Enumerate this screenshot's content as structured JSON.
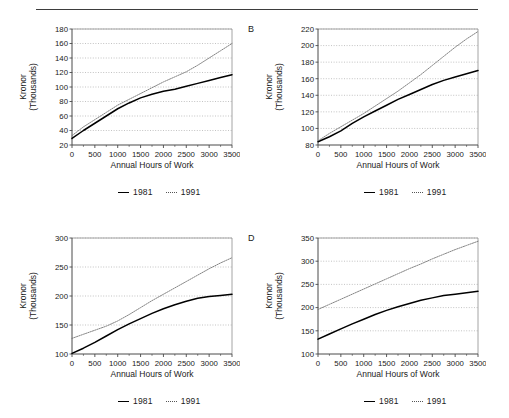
{
  "header": {
    "running_head": "",
    "rule": "horizontal-rule"
  },
  "common": {
    "x_axis_title": "Annual Hours of Work",
    "y_axis_title_line1": "Kronor",
    "y_axis_title_line2": "(Thousands)",
    "x_ticks": [
      "0",
      "500",
      "1000",
      "1500",
      "2000",
      "2500",
      "3000",
      "3500"
    ],
    "legend": {
      "series1_label": "1981",
      "series2_label": "1991",
      "series1_style": "solid-black",
      "series2_style": "dotted-gray"
    },
    "colors": {
      "series_1981": "#000000",
      "series_1991": "#6e6e6e",
      "axis": "#4a4a4a",
      "grid": "#9b9b9b",
      "background": "#ffffff"
    }
  },
  "panels": [
    {
      "letter": "A",
      "letter_visible": false
    },
    {
      "letter": "B",
      "letter_visible": true
    },
    {
      "letter": "C",
      "letter_visible": false
    },
    {
      "letter": "D",
      "letter_visible": true
    }
  ],
  "chart_data": [
    {
      "id": "panel-a",
      "type": "line",
      "panel_label": "A",
      "title": "",
      "xlabel": "Annual Hours of Work",
      "ylabel": "Kronor (Thousands)",
      "xlim": [
        0,
        3500
      ],
      "ylim": [
        20,
        180
      ],
      "xticks": [
        0,
        500,
        1000,
        1500,
        2000,
        2500,
        3000,
        3500
      ],
      "yticks": [
        20,
        40,
        60,
        80,
        100,
        120,
        140,
        160,
        180
      ],
      "grid": true,
      "legend_position": "below-center",
      "x": [
        0,
        250,
        500,
        750,
        1000,
        1250,
        1500,
        1750,
        2000,
        2250,
        2500,
        2750,
        3000,
        3250,
        3500
      ],
      "series": [
        {
          "name": "1981",
          "style": "solid",
          "color": "#000000",
          "values": [
            29,
            40,
            50,
            60,
            70,
            78,
            85,
            90,
            94,
            97,
            101,
            105,
            109,
            113,
            117
          ]
        },
        {
          "name": "1991",
          "style": "dotted",
          "color": "#6e6e6e",
          "values": [
            33,
            45,
            55,
            65,
            75,
            83,
            91,
            99,
            107,
            114,
            121,
            130,
            140,
            150,
            160
          ]
        }
      ]
    },
    {
      "id": "panel-b",
      "type": "line",
      "panel_label": "B",
      "title": "",
      "xlabel": "Annual Hours of Work",
      "ylabel": "Kronor (Thousands)",
      "xlim": [
        0,
        3500
      ],
      "ylim": [
        80,
        220
      ],
      "xticks": [
        0,
        500,
        1000,
        1500,
        2000,
        2500,
        3000,
        3500
      ],
      "yticks": [
        80,
        100,
        120,
        140,
        160,
        180,
        200,
        220
      ],
      "grid": true,
      "legend_position": "below-center",
      "x": [
        0,
        250,
        500,
        750,
        1000,
        1250,
        1500,
        1750,
        2000,
        2250,
        2500,
        2750,
        3000,
        3250,
        3500
      ],
      "series": [
        {
          "name": "1981",
          "style": "solid",
          "color": "#000000",
          "values": [
            84,
            90,
            97,
            106,
            114,
            121,
            128,
            135,
            141,
            147,
            153,
            158,
            162,
            166,
            170
          ]
        },
        {
          "name": "1991",
          "style": "dotted",
          "color": "#6e6e6e",
          "values": [
            85,
            94,
            102,
            110,
            118,
            127,
            136,
            145,
            155,
            165,
            176,
            187,
            198,
            208,
            217
          ]
        }
      ]
    },
    {
      "id": "panel-c",
      "type": "line",
      "panel_label": "C",
      "title": "",
      "xlabel": "Annual Hours of Work",
      "ylabel": "Kronor (Thousands)",
      "xlim": [
        0,
        3500
      ],
      "ylim": [
        100,
        300
      ],
      "xticks": [
        0,
        500,
        1000,
        1500,
        2000,
        2500,
        3000,
        3500
      ],
      "yticks": [
        100,
        150,
        200,
        250,
        300
      ],
      "grid": true,
      "legend_position": "below-center",
      "x": [
        0,
        250,
        500,
        750,
        1000,
        1250,
        1500,
        1750,
        2000,
        2250,
        2500,
        2750,
        3000,
        3250,
        3500
      ],
      "series": [
        {
          "name": "1981",
          "style": "solid",
          "color": "#000000",
          "values": [
            101,
            110,
            120,
            131,
            142,
            152,
            161,
            170,
            178,
            185,
            191,
            196,
            199,
            201,
            203
          ]
        },
        {
          "name": "1991",
          "style": "dotted",
          "color": "#6e6e6e",
          "values": [
            127,
            134,
            141,
            148,
            157,
            168,
            180,
            192,
            203,
            214,
            225,
            236,
            247,
            257,
            266
          ]
        }
      ]
    },
    {
      "id": "panel-d",
      "type": "line",
      "panel_label": "D",
      "title": "",
      "xlabel": "Annual Hours of Work",
      "ylabel": "Kronor (Thousands)",
      "xlim": [
        0,
        3500
      ],
      "ylim": [
        100,
        350
      ],
      "xticks": [
        0,
        500,
        1000,
        1500,
        2000,
        2500,
        3000,
        3500
      ],
      "yticks": [
        100,
        150,
        200,
        250,
        300,
        350
      ],
      "grid": true,
      "legend_position": "below-center",
      "x": [
        0,
        250,
        500,
        750,
        1000,
        1250,
        1500,
        1750,
        2000,
        2250,
        2500,
        2750,
        3000,
        3250,
        3500
      ],
      "series": [
        {
          "name": "1981",
          "style": "solid",
          "color": "#000000",
          "values": [
            132,
            143,
            154,
            165,
            175,
            185,
            194,
            202,
            209,
            216,
            221,
            226,
            229,
            232,
            235
          ]
        },
        {
          "name": "1991",
          "style": "dotted",
          "color": "#6e6e6e",
          "values": [
            196,
            207,
            218,
            229,
            240,
            251,
            262,
            273,
            284,
            294,
            305,
            315,
            325,
            334,
            343
          ]
        }
      ]
    }
  ]
}
